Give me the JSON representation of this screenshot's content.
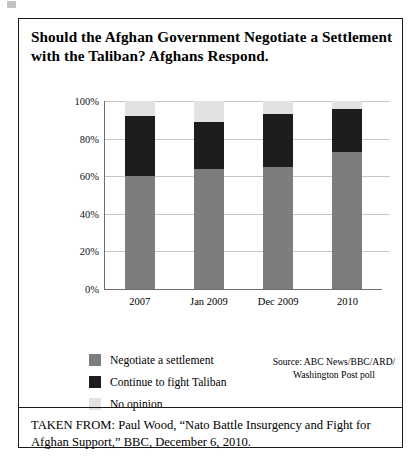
{
  "title": "Should the Afghan Government Negotiate a Settlement with the Taliban? Afghans Respond.",
  "source": "Source: ABC News/BBC/ARD/ Washington Post poll",
  "caption": "TAKEN FROM: Paul Wood, “Nato Battle Insurgency and Fight for Afghan Support,” BBC, December 6, 2010.",
  "legend": {
    "items": [
      {
        "label": "Negotiate a settlement",
        "color": "#7d7d7d"
      },
      {
        "label": "Continue to fight Taliban",
        "color": "#1d1d1d"
      },
      {
        "label": "No opinion",
        "color": "#e2e2e2"
      }
    ]
  },
  "chart_data": {
    "type": "bar",
    "subtype": "stacked-column",
    "title": "Should the Afghan Government Negotiate a Settlement with the Taliban? Afghans Respond.",
    "xlabel": "",
    "ylabel": "",
    "ylim": [
      0,
      100
    ],
    "yticks": [
      "0%",
      "20%",
      "40%",
      "60%",
      "80%",
      "100%"
    ],
    "ytick_values": [
      0,
      20,
      40,
      60,
      80,
      100
    ],
    "grid": true,
    "legend_position": "bottom-left",
    "categories": [
      "2007",
      "Jan 2009",
      "Dec 2009",
      "2010"
    ],
    "series": [
      {
        "name": "Negotiate a settlement",
        "color": "#7d7d7d",
        "values": [
          60,
          64,
          65,
          73
        ]
      },
      {
        "name": "Continue to fight Taliban",
        "color": "#1d1d1d",
        "values": [
          32,
          25,
          28,
          23
        ]
      },
      {
        "name": "No opinion",
        "color": "#e2e2e2",
        "values": [
          8,
          11,
          7,
          4
        ]
      }
    ],
    "source": "Source: ABC News/BBC/ARD/ Washington Post poll"
  }
}
